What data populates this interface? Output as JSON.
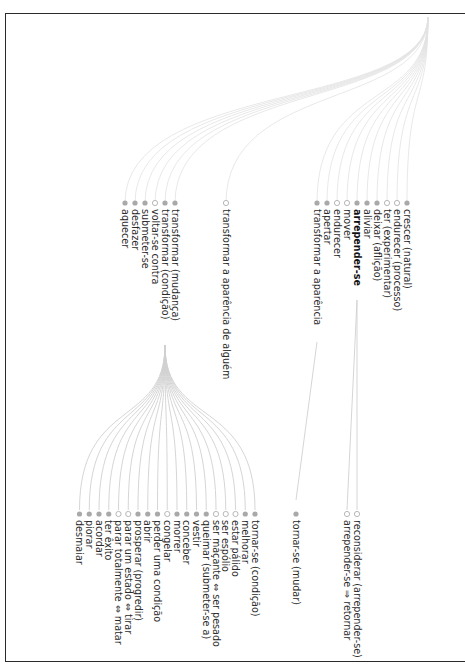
{
  "header": {
    "partial_text": ""
  },
  "diagram": {
    "orientation": "rotated-90-clockwise",
    "root": {
      "children_group_1": [
        {
          "label": "crescer (natural)",
          "node": "filled"
        },
        {
          "label": "endurecer (processo)",
          "node": "open"
        },
        {
          "label": "ter (experimentar)",
          "node": "open"
        },
        {
          "label": "deixar (aflição)",
          "node": "filled"
        },
        {
          "label": "aliviar",
          "node": "filled"
        },
        {
          "label": "arrepender-se",
          "node": "filled",
          "bold": true
        },
        {
          "label": "mover",
          "node": "open"
        },
        {
          "label": "endurecer",
          "node": "open"
        },
        {
          "label": "apertar",
          "node": "filled"
        },
        {
          "label": "transformar a aparência",
          "node": "filled"
        }
      ],
      "arrepender_children": [
        {
          "label": "reconsiderar (arrepender-se)",
          "node": "open"
        },
        {
          "label": "arrepender-se ⇒ retornar",
          "node": "open"
        }
      ],
      "transformar_aparencia_child": {
        "label": "tornar-se (mudar)",
        "node": "filled"
      },
      "middle_node": {
        "label": "transformar a aparência de alguém",
        "node": "open"
      },
      "children_group_2": [
        {
          "label": "transformar (mudança)",
          "node": "filled"
        },
        {
          "label": "transformar (condição)",
          "node": "filled"
        },
        {
          "label": "voltar-se contra",
          "node": "open"
        },
        {
          "label": "submeter-se",
          "node": "filled"
        },
        {
          "label": "desfazer",
          "node": "filled"
        },
        {
          "label": "aquecer",
          "node": "filled"
        }
      ],
      "condicao_children": [
        {
          "label": "tornar-se (condição)",
          "node": "filled"
        },
        {
          "label": "melhorar",
          "node": "filled"
        },
        {
          "label": "estar pálido",
          "node": "open"
        },
        {
          "label": "ser espólio",
          "node": "open"
        },
        {
          "label": "ser maçante ⇔ ser pesado",
          "node": "open"
        },
        {
          "label": "queimar (submeter-se a)",
          "node": "filled"
        },
        {
          "label": "vestir",
          "node": "filled"
        },
        {
          "label": "conceber",
          "node": "filled"
        },
        {
          "label": "morrer",
          "node": "filled"
        },
        {
          "label": "congelar",
          "node": "open"
        },
        {
          "label": "perder uma condição",
          "node": "filled"
        },
        {
          "label": "abrir",
          "node": "filled"
        },
        {
          "label": "prosperar (progredir)",
          "node": "filled"
        },
        {
          "label": "parar um estado ⇔ tirar",
          "node": "open"
        },
        {
          "label": "parar totalmente ⇔ matar",
          "node": "open"
        },
        {
          "label": "ter êxito",
          "node": "filled"
        },
        {
          "label": "acordar",
          "node": "filled"
        },
        {
          "label": "piorar",
          "node": "filled"
        },
        {
          "label": "desmaiar",
          "node": "filled"
        }
      ]
    }
  },
  "colors": {
    "node_filled": "#a9a9a9",
    "node_open_stroke": "#b0b0b0",
    "edge": "#e2e2e2",
    "frame": "#2a2a2a",
    "text": "#2b2b2b"
  }
}
